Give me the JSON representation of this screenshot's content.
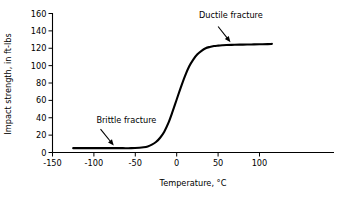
{
  "chart_data": {
    "type": "line",
    "title": "",
    "xlabel": "Temperature, °C",
    "ylabel": "Impact strength, in ft-lbs",
    "xlim": [
      -150,
      190
    ],
    "ylim": [
      0,
      160
    ],
    "xticks": [
      -150,
      -100,
      -50,
      0,
      50,
      100
    ],
    "xticklabels": [
      "-150",
      "-100",
      "-50",
      "0",
      "50",
      "100"
    ],
    "yticks": [
      0,
      20,
      40,
      60,
      80,
      100,
      120,
      140,
      160
    ],
    "yticklabels": [
      "0",
      "20",
      "40",
      "60",
      "80",
      "100",
      "120",
      "140",
      "160"
    ],
    "grid": false,
    "legend": false,
    "series": [
      {
        "name": "Impact strength vs temperature",
        "x": [
          -125,
          -115,
          -105,
          -95,
          -85,
          -75,
          -65,
          -55,
          -45,
          -40,
          -35,
          -30,
          -25,
          -20,
          -15,
          -10,
          -5,
          0,
          5,
          10,
          15,
          20,
          25,
          30,
          35,
          40,
          45,
          50,
          55,
          60,
          70,
          80,
          90,
          100,
          110,
          115
        ],
        "y": [
          5,
          5,
          5,
          5,
          5,
          5,
          5,
          5,
          5.5,
          6,
          7,
          9,
          12,
          17,
          24,
          34,
          47,
          61,
          75,
          88,
          99,
          107,
          113,
          117,
          120,
          121.5,
          122.5,
          123,
          123.4,
          123.7,
          124,
          124.2,
          124.4,
          124.6,
          124.8,
          125
        ]
      }
    ],
    "annotations": [
      {
        "text": "Brittle fracture",
        "text_x": -97,
        "text_y": 34,
        "arrow_from_x": -92,
        "arrow_from_y": 27,
        "arrow_to_x": -76,
        "arrow_to_y": 8
      },
      {
        "text": "Ductile fracture",
        "text_x": 27,
        "text_y": 155,
        "arrow_from_x": 50,
        "arrow_from_y": 145,
        "arrow_to_x": 65,
        "arrow_to_y": 127
      }
    ]
  }
}
